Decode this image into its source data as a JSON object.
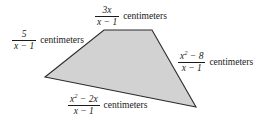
{
  "figure": {
    "fill_color": "#d2d2d2",
    "stroke_color": "#2b2b2b",
    "background_color": "#ffffff",
    "vertices": [
      {
        "name": "left",
        "x": 45,
        "y": 77
      },
      {
        "name": "top-left",
        "x": 104,
        "y": 30
      },
      {
        "name": "top-right",
        "x": 152,
        "y": 30
      },
      {
        "name": "right",
        "x": 196,
        "y": 107
      }
    ]
  },
  "labels": {
    "top": {
      "numerator": "3x",
      "denominator": "x − 1",
      "unit": "centimeters",
      "side": "top"
    },
    "left": {
      "numerator": "5",
      "denominator": "x − 1",
      "unit": "centimeters",
      "side": "upper-left"
    },
    "right": {
      "numerator_base": "x",
      "numerator_exponent": "2",
      "numerator_rest": "− 8",
      "denominator": "x − 1",
      "unit": "centimeters",
      "side": "right"
    },
    "bottom": {
      "numerator_base": "x",
      "numerator_exponent": "2",
      "numerator_rest": "− 2x",
      "denominator": "x − 1",
      "unit": "centimeters",
      "side": "bottom"
    }
  }
}
